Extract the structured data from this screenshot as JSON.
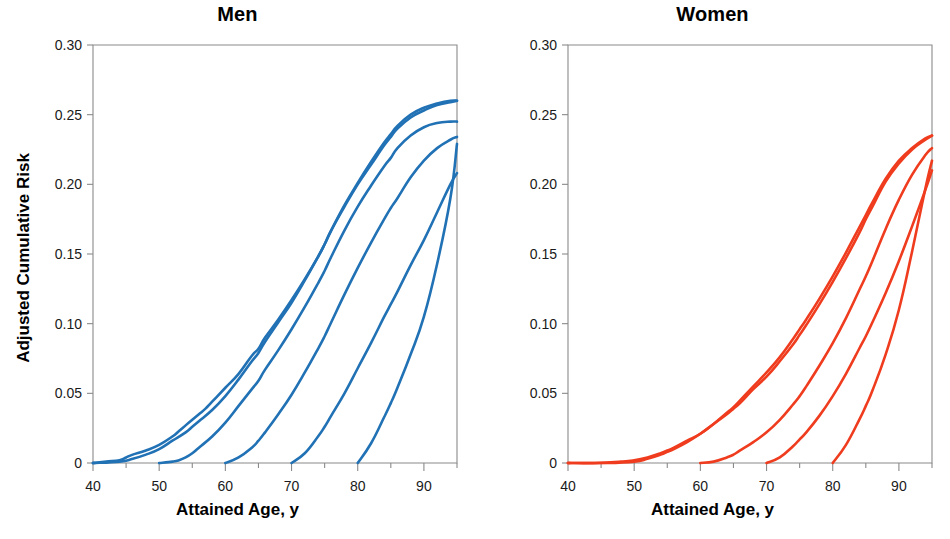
{
  "figure": {
    "background_color": "#ffffff",
    "axis_color": "#8a8a8a",
    "text_color": "#000000"
  },
  "panels": [
    {
      "key": "men",
      "title": "Men",
      "color": "#2171B5",
      "xlabel": "Attained Age, y",
      "ylabel": "Adjusted Cumulative Risk"
    },
    {
      "key": "women",
      "title": "Women",
      "color": "#F03C1E",
      "xlabel": "Attained Age, y",
      "ylabel": "Adjusted Cumulative Risk"
    }
  ],
  "axes": {
    "x_ticks": [
      "40",
      "50",
      "60",
      "70",
      "80",
      "90"
    ],
    "x_tick_values": [
      40,
      50,
      60,
      70,
      80,
      90
    ],
    "x_minor_values": [
      45,
      55,
      65,
      75,
      85,
      95
    ],
    "y_ticks": [
      "0",
      "0.05",
      "0.10",
      "0.15",
      "0.20",
      "0.25",
      "0.30"
    ],
    "y_tick_values": [
      0,
      0.05,
      0.1,
      0.15,
      0.2,
      0.25,
      0.3
    ],
    "xlim": [
      40,
      95
    ],
    "ylim": [
      0,
      0.3
    ]
  },
  "chart_data": {
    "type": "line",
    "xlabel": "Attained Age, y",
    "ylabel": "Adjusted Cumulative Risk",
    "xlim": [
      40,
      95
    ],
    "ylim": [
      0,
      0.3
    ],
    "grid": false,
    "legend": "none",
    "panels": [
      {
        "name": "Men",
        "color": "#2171B5",
        "series": [
          {
            "name": "men-curve-1",
            "x": [
              40,
              42,
              44,
              45,
              46,
              48,
              50,
              52,
              53,
              54,
              55,
              56,
              57,
              58,
              60,
              62,
              64,
              65,
              66,
              68,
              70,
              72,
              74,
              75,
              76,
              78,
              80,
              82,
              84,
              85,
              86,
              88,
              90,
              92,
              94,
              95
            ],
            "y": [
              0.0,
              0.001,
              0.002,
              0.004,
              0.006,
              0.009,
              0.013,
              0.019,
              0.023,
              0.027,
              0.031,
              0.035,
              0.039,
              0.044,
              0.054,
              0.064,
              0.077,
              0.082,
              0.09,
              0.103,
              0.117,
              0.132,
              0.148,
              0.157,
              0.167,
              0.184,
              0.2,
              0.214,
              0.228,
              0.234,
              0.24,
              0.248,
              0.253,
              0.257,
              0.259,
              0.26
            ]
          },
          {
            "name": "men-curve-2",
            "x": [
              40,
              44,
              46,
              48,
              50,
              52,
              54,
              55,
              56,
              58,
              60,
              62,
              64,
              65,
              66,
              68,
              70,
              72,
              74,
              75,
              76,
              78,
              80,
              82,
              84,
              85,
              86,
              88,
              90,
              92,
              94,
              95
            ],
            "y": [
              0.0,
              0.001,
              0.003,
              0.006,
              0.01,
              0.016,
              0.022,
              0.026,
              0.03,
              0.038,
              0.048,
              0.06,
              0.073,
              0.079,
              0.087,
              0.101,
              0.115,
              0.131,
              0.148,
              0.157,
              0.167,
              0.185,
              0.201,
              0.216,
              0.23,
              0.236,
              0.242,
              0.25,
              0.255,
              0.258,
              0.26,
              0.26
            ]
          },
          {
            "name": "men-curve-3",
            "x": [
              50,
              52,
              53,
              54,
              55,
              56,
              58,
              60,
              62,
              64,
              65,
              66,
              68,
              70,
              72,
              74,
              75,
              76,
              78,
              80,
              82,
              84,
              85,
              86,
              88,
              90,
              92,
              94,
              95
            ],
            "y": [
              0.0,
              0.001,
              0.002,
              0.004,
              0.007,
              0.011,
              0.019,
              0.029,
              0.041,
              0.053,
              0.059,
              0.067,
              0.081,
              0.096,
              0.112,
              0.129,
              0.138,
              0.148,
              0.167,
              0.184,
              0.199,
              0.213,
              0.219,
              0.226,
              0.235,
              0.241,
              0.244,
              0.245,
              0.245
            ]
          },
          {
            "name": "men-curve-4",
            "x": [
              60,
              62,
              64,
              65,
              66,
              68,
              70,
              72,
              74,
              75,
              76,
              78,
              80,
              82,
              84,
              85,
              86,
              88,
              90,
              92,
              94,
              95
            ],
            "y": [
              0.0,
              0.004,
              0.011,
              0.016,
              0.022,
              0.035,
              0.049,
              0.065,
              0.082,
              0.091,
              0.101,
              0.121,
              0.14,
              0.158,
              0.175,
              0.183,
              0.19,
              0.205,
              0.217,
              0.226,
              0.232,
              0.234
            ]
          },
          {
            "name": "men-curve-5",
            "x": [
              70,
              72,
              74,
              75,
              76,
              78,
              80,
              82,
              84,
              85,
              86,
              88,
              90,
              92,
              94,
              95
            ],
            "y": [
              0.0,
              0.007,
              0.019,
              0.026,
              0.034,
              0.05,
              0.068,
              0.086,
              0.105,
              0.114,
              0.123,
              0.142,
              0.16,
              0.18,
              0.2,
              0.208
            ]
          },
          {
            "name": "men-curve-6",
            "x": [
              80,
              82,
              84,
              85,
              86,
              88,
              90,
              92,
              94,
              95
            ],
            "y": [
              0.0,
              0.014,
              0.033,
              0.043,
              0.054,
              0.078,
              0.105,
              0.143,
              0.19,
              0.229
            ]
          }
        ]
      },
      {
        "name": "Women",
        "color": "#F03C1E",
        "series": [
          {
            "name": "women-curve-1",
            "x": [
              40,
              44,
              48,
              50,
              52,
              54,
              55,
              56,
              58,
              60,
              62,
              64,
              65,
              66,
              68,
              70,
              72,
              74,
              75,
              76,
              78,
              80,
              82,
              84,
              85,
              86,
              88,
              90,
              92,
              94,
              95
            ],
            "y": [
              0.0,
              0.0,
              0.001,
              0.002,
              0.004,
              0.007,
              0.009,
              0.011,
              0.016,
              0.021,
              0.028,
              0.035,
              0.039,
              0.043,
              0.053,
              0.062,
              0.073,
              0.085,
              0.092,
              0.099,
              0.114,
              0.13,
              0.147,
              0.165,
              0.175,
              0.184,
              0.202,
              0.215,
              0.225,
              0.232,
              0.235
            ]
          },
          {
            "name": "women-curve-2",
            "x": [
              40,
              46,
              50,
              52,
              54,
              55,
              56,
              58,
              60,
              62,
              64,
              65,
              66,
              68,
              70,
              72,
              74,
              75,
              76,
              78,
              80,
              82,
              84,
              85,
              86,
              88,
              90,
              92,
              94,
              95
            ],
            "y": [
              0.0,
              0.0,
              0.001,
              0.003,
              0.006,
              0.008,
              0.01,
              0.015,
              0.021,
              0.028,
              0.036,
              0.04,
              0.045,
              0.055,
              0.065,
              0.076,
              0.089,
              0.096,
              0.103,
              0.118,
              0.134,
              0.151,
              0.169,
              0.178,
              0.187,
              0.204,
              0.217,
              0.226,
              0.233,
              0.235
            ]
          },
          {
            "name": "women-curve-3",
            "x": [
              60,
              62,
              64,
              65,
              66,
              68,
              70,
              72,
              74,
              75,
              76,
              78,
              80,
              82,
              84,
              85,
              86,
              88,
              90,
              92,
              94,
              95
            ],
            "y": [
              0.0,
              0.001,
              0.004,
              0.006,
              0.009,
              0.015,
              0.022,
              0.031,
              0.042,
              0.048,
              0.055,
              0.07,
              0.086,
              0.104,
              0.124,
              0.134,
              0.145,
              0.168,
              0.189,
              0.207,
              0.221,
              0.226
            ]
          },
          {
            "name": "women-curve-4",
            "x": [
              70,
              72,
              74,
              75,
              76,
              78,
              80,
              82,
              84,
              85,
              86,
              88,
              90,
              92,
              94,
              95
            ],
            "y": [
              0.0,
              0.004,
              0.012,
              0.017,
              0.022,
              0.034,
              0.048,
              0.064,
              0.082,
              0.091,
              0.101,
              0.122,
              0.145,
              0.17,
              0.196,
              0.21
            ]
          },
          {
            "name": "women-curve-5",
            "x": [
              80,
              82,
              84,
              85,
              86,
              88,
              90,
              92,
              94,
              95
            ],
            "y": [
              0.0,
              0.013,
              0.031,
              0.041,
              0.052,
              0.078,
              0.11,
              0.152,
              0.197,
              0.217
            ]
          }
        ]
      }
    ]
  }
}
